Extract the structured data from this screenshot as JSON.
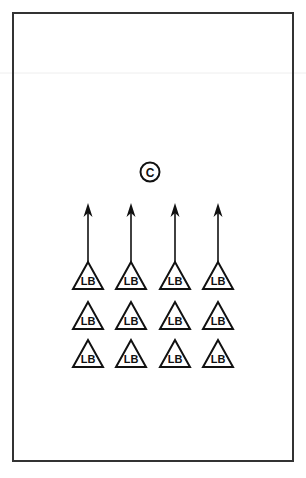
{
  "diagram": {
    "center": {
      "label": "C",
      "shape": "circle"
    },
    "linebacker_label": "LB",
    "columns": 4,
    "rows": 3,
    "arrow_direction": "up",
    "arrows_on_row": 1,
    "colors": {
      "stroke": "#111111",
      "background": "#ffffff",
      "border": "#333333"
    }
  }
}
